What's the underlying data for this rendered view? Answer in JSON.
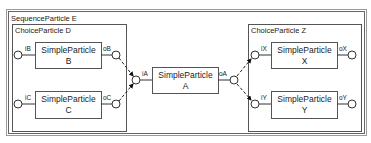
{
  "diagram": {
    "sequence": {
      "label": "SequenceParticle E"
    },
    "choice_left": {
      "label": "ChoiceParticle D"
    },
    "choice_right": {
      "label": "ChoiceParticle Z"
    },
    "particles": {
      "B": {
        "title": "SimpleParticle",
        "name": "B",
        "in": "iB",
        "out": "oB"
      },
      "C": {
        "title": "SimpleParticle",
        "name": "C",
        "in": "iC",
        "out": "oC"
      },
      "A": {
        "title": "SimpleParticle",
        "name": "A",
        "in": "iA",
        "out": "oA"
      },
      "X": {
        "title": "SimpleParticle",
        "name": "X",
        "in": "iX",
        "out": "oX"
      },
      "Y": {
        "title": "SimpleParticle",
        "name": "Y",
        "in": "iY",
        "out": "oY"
      }
    },
    "colors": {
      "border": "#555555",
      "outer_border": "#8a8a8a",
      "line": "#333333",
      "text": "#222222"
    }
  }
}
